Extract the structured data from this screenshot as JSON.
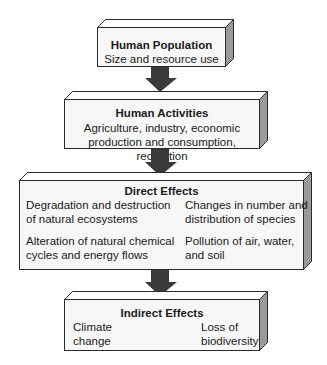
{
  "boxes": {
    "population": {
      "title": "Human Population",
      "line1": "Size and resource use"
    },
    "activities": {
      "title": "Human Activities",
      "line1": "Agriculture, industry, economic",
      "line2": "production and consumption, recreation"
    },
    "direct": {
      "title": "Direct Effects",
      "items": [
        {
          "line1": "Degradation and destruction",
          "line2": "of natural ecosystems"
        },
        {
          "line1": "Changes in number and",
          "line2": "distribution of species"
        },
        {
          "line1": "Alteration of natural chemical",
          "line2": "cycles and energy flows"
        },
        {
          "line1": "Pollution of air, water,",
          "line2": "and soil"
        }
      ]
    },
    "indirect": {
      "title": "Indirect Effects",
      "items": [
        {
          "line1": "Climate",
          "line2": "change"
        },
        {
          "line1": "Loss of",
          "line2": "biodiversity"
        }
      ]
    }
  },
  "colors": {
    "arrow": "#3a3a3a",
    "box_front": "#f7f7f7",
    "box_top": "#ffffff",
    "box_side": "#9a9a9a",
    "outline": "#2a2a2a"
  }
}
